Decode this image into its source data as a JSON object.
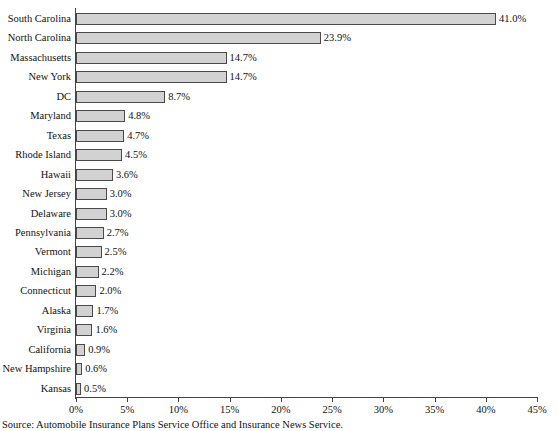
{
  "chart_data": {
    "type": "bar",
    "orientation": "horizontal",
    "title": "",
    "xlabel": "",
    "ylabel": "",
    "xlim": [
      0,
      45
    ],
    "xtick_labels": [
      "0%",
      "5%",
      "10%",
      "15%",
      "20%",
      "25%",
      "30%",
      "35%",
      "40%",
      "45%"
    ],
    "xtick_values": [
      0,
      5,
      10,
      15,
      20,
      25,
      30,
      35,
      40,
      45
    ],
    "grid": false,
    "legend": null,
    "value_suffix": "%",
    "categories": [
      "South Carolina",
      "North Carolina",
      "Massachusetts",
      "New York",
      "DC",
      "Maryland",
      "Texas",
      "Rhode Island",
      "Hawaii",
      "New Jersey",
      "Delaware",
      "Pennsylvania",
      "Vermont",
      "Michigan",
      "Connecticut",
      "Alaska",
      "Virginia",
      "California",
      "New Hampshire",
      "Kansas"
    ],
    "values": [
      41.0,
      23.9,
      14.7,
      14.7,
      8.7,
      4.8,
      4.7,
      4.5,
      3.6,
      3.0,
      3.0,
      2.7,
      2.5,
      2.2,
      2.0,
      1.7,
      1.6,
      0.9,
      0.6,
      0.5
    ],
    "data_labels": [
      "41.0%",
      "23.9%",
      "14.7%",
      "14.7%",
      "8.7%",
      "4.8%",
      "4.7%",
      "4.5%",
      "3.6%",
      "3.0%",
      "3.0%",
      "2.7%",
      "2.5%",
      "2.2%",
      "2.0%",
      "1.7%",
      "1.6%",
      "0.9%",
      "0.6%",
      "0.5%"
    ],
    "bar_color": "#d2d2d2",
    "bar_border_color": "#4a4a4a"
  },
  "footer": {
    "source": "Source: Automobile Insurance Plans Service Office and Insurance News Service."
  }
}
